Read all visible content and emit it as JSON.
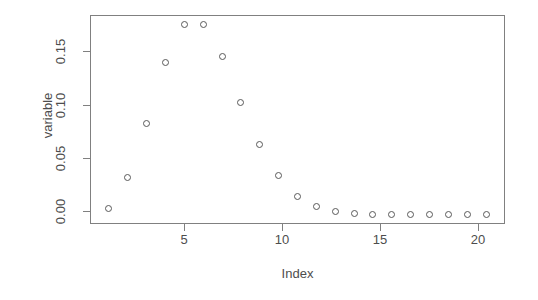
{
  "chart_data": {
    "type": "scatter",
    "title": "",
    "xlabel": "Index",
    "ylabel": "variable",
    "x": [
      1,
      2,
      3,
      4,
      5,
      6,
      7,
      8,
      9,
      10,
      11,
      12,
      13,
      14,
      15,
      16,
      17,
      18,
      19,
      20,
      21
    ],
    "values": [
      0.006,
      0.034,
      0.084,
      0.141,
      0.176,
      0.176,
      0.146,
      0.104,
      0.065,
      0.036,
      0.017,
      0.007,
      0.003,
      0.001,
      0.0,
      0.0,
      0.0,
      0.0,
      0.0,
      0.0,
      0.0
    ],
    "xticks": [
      5,
      10,
      15,
      20
    ],
    "xticklabels": [
      "5",
      "10",
      "15",
      "20"
    ],
    "yticks": [
      0.0,
      0.05,
      0.1,
      0.15
    ],
    "yticklabels": [
      "0.00",
      "0.05",
      "0.10",
      "0.15"
    ],
    "xlim": [
      0.0,
      22.0
    ],
    "ylim": [
      -0.0088,
      0.1848
    ],
    "grid": false,
    "legend": null,
    "marker": "open-circle",
    "marker_color": "#595959",
    "axis_color": "#808080",
    "background": "#ffffff"
  },
  "axes": {
    "x_title": "Index",
    "y_title": "variable"
  }
}
